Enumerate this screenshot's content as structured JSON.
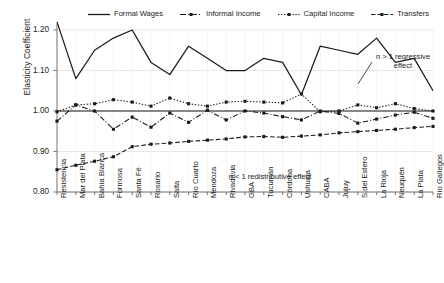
{
  "chart_data": {
    "type": "line",
    "title": "",
    "xlabel": "",
    "ylabel": "Elasticity Coefficient",
    "ylim": [
      0.8,
      1.2
    ],
    "yticks": [
      0.8,
      0.9,
      1.0,
      1.1,
      1.2
    ],
    "ytick_labels": [
      "0.80",
      "0.90",
      "1.00",
      "1.10",
      "1.20"
    ],
    "grid": true,
    "legend_position": "top",
    "reference_line": 1.0,
    "categories": [
      "Resistencia",
      "Mar del Plata",
      "Bahía Blanca",
      "Formosa",
      "Santa Fé",
      "Rosario",
      "Salta",
      "Río Cuarto",
      "Mendoza",
      "Rivadavia",
      "GBA",
      "Tucumán",
      "Córdoba",
      "Ushuaia",
      "CABA",
      "Jujuy",
      "S.del Estero",
      "La Rioja",
      "Neuquén",
      "La Plata",
      "Río Gallegos"
    ],
    "series": [
      {
        "name": "Formal Wages",
        "style": "solid",
        "marker": "none",
        "color": "#1a1a1a",
        "values": [
          1.22,
          1.08,
          1.15,
          1.18,
          1.2,
          1.12,
          1.09,
          1.16,
          1.13,
          1.1,
          1.1,
          1.13,
          1.12,
          1.04,
          1.16,
          1.15,
          1.14,
          1.18,
          1.12,
          1.13,
          1.05
        ]
      },
      {
        "name": "Informal Income",
        "style": "dashdot",
        "marker": "square",
        "color": "#1a1a1a",
        "values": [
          0.975,
          1.015,
          1.0,
          0.955,
          0.985,
          0.96,
          0.995,
          0.972,
          1.002,
          0.978,
          1.0,
          0.995,
          0.986,
          0.978,
          1.0,
          0.994,
          0.97,
          0.98,
          0.99,
          0.997,
          0.982
        ]
      },
      {
        "name": "Capital Income",
        "style": "dotted",
        "marker": "square",
        "color": "#1a1a1a",
        "values": [
          0.998,
          1.015,
          1.018,
          1.028,
          1.022,
          1.012,
          1.032,
          1.018,
          1.012,
          1.022,
          1.024,
          1.022,
          1.02,
          1.042,
          0.998,
          1.0,
          1.015,
          1.008,
          1.018,
          1.006,
          1.0
        ]
      },
      {
        "name": "Transfers",
        "style": "dashed",
        "marker": "square",
        "color": "#1a1a1a",
        "values": [
          0.855,
          0.866,
          0.876,
          0.887,
          0.912,
          0.918,
          0.921,
          0.925,
          0.928,
          0.931,
          0.936,
          0.937,
          0.935,
          0.938,
          0.941,
          0.946,
          0.949,
          0.952,
          0.955,
          0.959,
          0.962
        ]
      }
    ],
    "annotations": [
      {
        "text": "n > 1 regressive\neffect",
        "position": "upper-right"
      },
      {
        "text": "n < 1 redistributive effect",
        "position": "lower-center"
      }
    ]
  },
  "legend": {
    "items": [
      {
        "label": "Formal Wages",
        "icon": "solid-line-swatch"
      },
      {
        "label": "Informal Income",
        "icon": "dashdot-line-swatch"
      },
      {
        "label": "Capital Income",
        "icon": "dotted-line-swatch"
      },
      {
        "label": "Transfers",
        "icon": "dashed-line-swatch"
      }
    ]
  },
  "axes": {
    "y_title": "Elasticity Coefficient"
  }
}
